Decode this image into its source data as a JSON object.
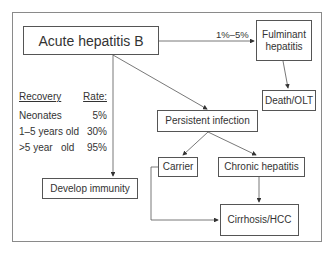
{
  "diagram": {
    "nodes": {
      "acute": "Acute hepatitis B",
      "fulminant": "Fulminant hepatitis",
      "death": "Death/OLT",
      "persistent": "Persistent infection",
      "carrier": "Carrier",
      "chronic": "Chronic hepatitis",
      "immunity": "Develop immunity",
      "cirrhosis": "Cirrhosis/HCC"
    },
    "edge_labels": {
      "acute_to_fulminant": "1%–5%"
    },
    "recovery_table": {
      "header": {
        "col1": "Recovery",
        "col2": "Rate:"
      },
      "rows": [
        {
          "group": "Neonates",
          "rate": "5%"
        },
        {
          "group": "1–5 years old",
          "rate": "30%"
        },
        {
          "group": ">5 year   old",
          "rate": "95%"
        }
      ]
    },
    "colors": {
      "line": "#555555",
      "frame": "#8a8a8a",
      "text": "#333333"
    }
  }
}
